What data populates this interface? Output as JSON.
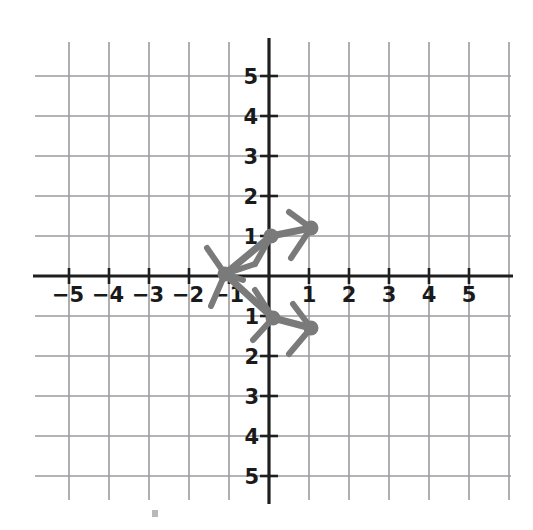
{
  "figure": {
    "kind": "hand-drawn-structure-on-graph-paper",
    "background_color": "#ffffff",
    "grid_color": "#9a9aa0",
    "axis_color": "#1f1f1f",
    "structure_color": "#7a7a7a",
    "label_color": "#1a1a1a"
  },
  "chart_data": {
    "type": "scatter",
    "title": "",
    "xlabel": "",
    "ylabel": "",
    "xlim": [
      -5.75,
      5.75
    ],
    "ylim": [
      -5.75,
      5.75
    ],
    "grid": true,
    "legend": null,
    "x_ticks": [
      -5,
      -4,
      -3,
      -2,
      -1,
      1,
      2,
      3,
      4,
      5
    ],
    "y_ticks": [
      5,
      4,
      3,
      2,
      1,
      -1,
      -2,
      -3,
      -4,
      -5
    ],
    "x_tick_labels": [
      "−5",
      "−4",
      "−3",
      "−2",
      "−1",
      "1",
      "2",
      "3",
      "4",
      "5"
    ],
    "y_tick_labels": [
      "5",
      "4",
      "3",
      "2",
      "1",
      "−1",
      "−2",
      "−3",
      "−4",
      "−5"
    ],
    "series": [
      {
        "name": "vertices",
        "points": [
          {
            "label": "left-vertex",
            "x": -1.1,
            "y": 0.05
          },
          {
            "label": "upper-inner-vertex",
            "x": 0.05,
            "y": 1.0
          },
          {
            "label": "upper-outer-vertex",
            "x": 1.05,
            "y": 1.2
          },
          {
            "label": "lower-inner-vertex",
            "x": 0.1,
            "y": -1.05
          },
          {
            "label": "lower-outer-vertex",
            "x": 1.05,
            "y": -1.3
          }
        ]
      },
      {
        "name": "bonds",
        "segments": [
          {
            "x1": -1.1,
            "y1": 0.05,
            "x2": 0.05,
            "y2": 1.0
          },
          {
            "x1": 0.05,
            "y1": 1.0,
            "x2": 1.05,
            "y2": 1.2
          },
          {
            "x1": -1.1,
            "y1": 0.05,
            "x2": 0.1,
            "y2": -1.05
          },
          {
            "x1": 0.1,
            "y1": -1.05,
            "x2": 1.05,
            "y2": -1.3
          }
        ]
      },
      {
        "name": "branch-stubs",
        "segments": [
          {
            "x1": -1.1,
            "y1": 0.05,
            "x2": -1.55,
            "y2": 0.7
          },
          {
            "x1": -1.1,
            "y1": 0.05,
            "x2": -0.35,
            "y2": 0.3
          },
          {
            "x1": -1.1,
            "y1": 0.05,
            "x2": -0.65,
            "y2": -0.1
          },
          {
            "x1": -1.1,
            "y1": 0.05,
            "x2": -1.45,
            "y2": -0.75
          },
          {
            "x1": 0.05,
            "y1": 1.0,
            "x2": -0.35,
            "y2": 0.3
          },
          {
            "x1": 1.05,
            "y1": 1.2,
            "x2": 0.5,
            "y2": 1.6
          },
          {
            "x1": 1.05,
            "y1": 1.2,
            "x2": 0.55,
            "y2": 0.45
          },
          {
            "x1": 0.1,
            "y1": -1.05,
            "x2": -0.35,
            "y2": -0.35
          },
          {
            "x1": 0.1,
            "y1": -1.05,
            "x2": -0.4,
            "y2": -1.6
          },
          {
            "x1": 1.05,
            "y1": -1.3,
            "x2": 0.6,
            "y2": -0.7
          },
          {
            "x1": 1.05,
            "y1": -1.3,
            "x2": 0.5,
            "y2": -1.95
          }
        ]
      }
    ]
  }
}
